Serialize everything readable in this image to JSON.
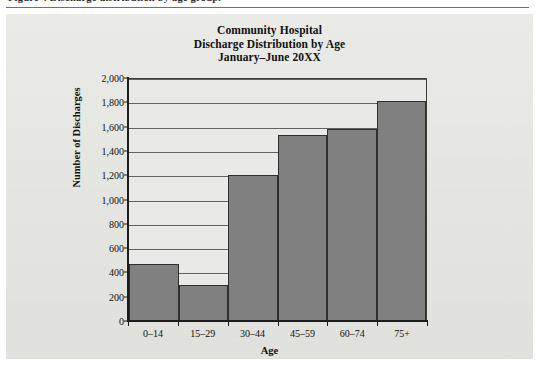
{
  "caption": {
    "text": "Figure 4  Discharge distribution by age group."
  },
  "chart_data": {
    "type": "bar",
    "title": "Community Hospital",
    "title_lines": [
      "Community Hospital",
      "Discharge Distribution by Age",
      "January–June 20XX"
    ],
    "xlabel": "Age",
    "ylabel": "Number of Discharges",
    "categories": [
      "0–14",
      "15–29",
      "30–44",
      "45–59",
      "60–74",
      "75+"
    ],
    "values": [
      460,
      290,
      1190,
      1520,
      1575,
      1800
    ],
    "ylim": [
      0,
      2000
    ],
    "ytick_step": 200,
    "ytick_labels": [
      "0",
      "200",
      "400",
      "600",
      "800",
      "1,000",
      "1,200",
      "1,400",
      "1,600",
      "1,800",
      "2,000"
    ],
    "ytick_values": [
      0,
      200,
      400,
      600,
      800,
      1000,
      1200,
      1400,
      1600,
      1800,
      2000
    ],
    "grid": true,
    "grid_axis": "y",
    "legend": false,
    "bar_gap": 0,
    "colors": {
      "bar_fill": "#808080",
      "bar_edge": "#2f2f2f",
      "plot_background": "#e9e9e7",
      "panel_background": "#e6e6e3",
      "axis": "#1d1d1d",
      "gridline": "#4a4a4a",
      "text": "#111111"
    }
  }
}
